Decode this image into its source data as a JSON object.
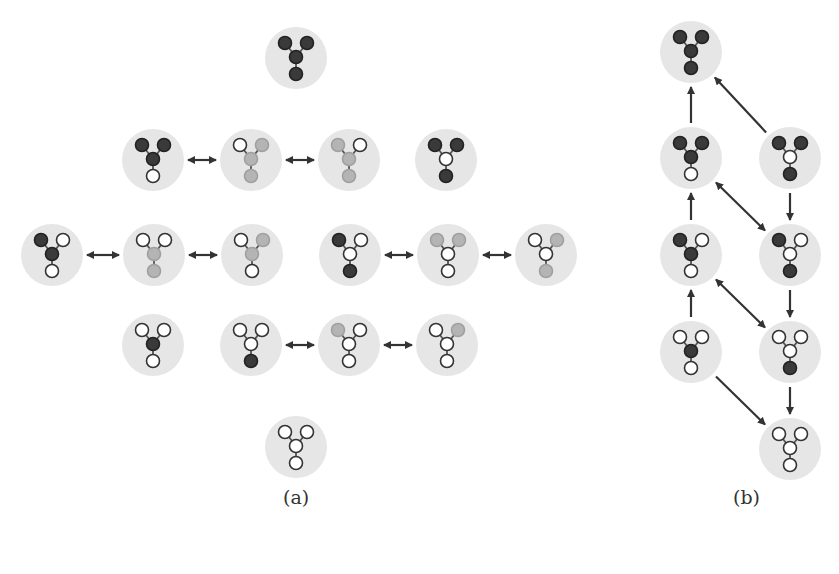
{
  "figure": {
    "panels": [
      {
        "id": "a",
        "caption": "(a)",
        "caption_pos": [
          283,
          502
        ],
        "nodes": [
          {
            "id": "a1",
            "x": 296,
            "y": 58,
            "states": [
              "D",
              "D",
              "D",
              "D"
            ]
          },
          {
            "id": "a2",
            "x": 153,
            "y": 160,
            "states": [
              "D",
              "D",
              "D",
              "W"
            ]
          },
          {
            "id": "a3",
            "x": 251,
            "y": 160,
            "states": [
              "W",
              "L",
              "L",
              "L"
            ]
          },
          {
            "id": "a4",
            "x": 349,
            "y": 160,
            "states": [
              "L",
              "W",
              "L",
              "L"
            ]
          },
          {
            "id": "a5",
            "x": 446,
            "y": 160,
            "states": [
              "D",
              "D",
              "W",
              "D"
            ]
          },
          {
            "id": "a6",
            "x": 52,
            "y": 255,
            "states": [
              "D",
              "W",
              "D",
              "W"
            ]
          },
          {
            "id": "a7",
            "x": 154,
            "y": 255,
            "states": [
              "W",
              "W",
              "L",
              "L"
            ]
          },
          {
            "id": "a8",
            "x": 252,
            "y": 255,
            "states": [
              "W",
              "L",
              "L",
              "W"
            ]
          },
          {
            "id": "a9",
            "x": 350,
            "y": 255,
            "states": [
              "D",
              "W",
              "W",
              "D"
            ]
          },
          {
            "id": "a10",
            "x": 448,
            "y": 255,
            "states": [
              "L",
              "L",
              "W",
              "W"
            ]
          },
          {
            "id": "a11",
            "x": 546,
            "y": 255,
            "states": [
              "W",
              "L",
              "W",
              "L"
            ]
          },
          {
            "id": "a12",
            "x": 153,
            "y": 345,
            "states": [
              "W",
              "W",
              "D",
              "W"
            ]
          },
          {
            "id": "a13",
            "x": 251,
            "y": 345,
            "states": [
              "W",
              "W",
              "W",
              "D"
            ]
          },
          {
            "id": "a14",
            "x": 349,
            "y": 345,
            "states": [
              "L",
              "W",
              "W",
              "W"
            ]
          },
          {
            "id": "a15",
            "x": 447,
            "y": 345,
            "states": [
              "W",
              "L",
              "W",
              "W"
            ]
          },
          {
            "id": "a16",
            "x": 296,
            "y": 447,
            "states": [
              "W",
              "W",
              "W",
              "W"
            ]
          }
        ],
        "edges": [
          {
            "from": "a2",
            "to": "a3",
            "type": "bidirectional"
          },
          {
            "from": "a3",
            "to": "a4",
            "type": "bidirectional"
          },
          {
            "from": "a6",
            "to": "a7",
            "type": "bidirectional"
          },
          {
            "from": "a7",
            "to": "a8",
            "type": "bidirectional"
          },
          {
            "from": "a9",
            "to": "a10",
            "type": "bidirectional"
          },
          {
            "from": "a10",
            "to": "a11",
            "type": "bidirectional"
          },
          {
            "from": "a13",
            "to": "a14",
            "type": "bidirectional"
          },
          {
            "from": "a14",
            "to": "a15",
            "type": "bidirectional"
          }
        ]
      },
      {
        "id": "b",
        "caption": "(b)",
        "caption_pos": [
          733,
          502
        ],
        "nodes": [
          {
            "id": "b1",
            "x": 691,
            "y": 52,
            "states": [
              "D",
              "D",
              "D",
              "D"
            ]
          },
          {
            "id": "b2",
            "x": 691,
            "y": 158,
            "states": [
              "D",
              "D",
              "D",
              "W"
            ]
          },
          {
            "id": "b3",
            "x": 790,
            "y": 158,
            "states": [
              "D",
              "D",
              "W",
              "D"
            ]
          },
          {
            "id": "b4",
            "x": 691,
            "y": 255,
            "states": [
              "D",
              "W",
              "D",
              "W"
            ]
          },
          {
            "id": "b5",
            "x": 790,
            "y": 255,
            "states": [
              "D",
              "W",
              "W",
              "D"
            ]
          },
          {
            "id": "b6",
            "x": 691,
            "y": 352,
            "states": [
              "W",
              "W",
              "D",
              "W"
            ]
          },
          {
            "id": "b7",
            "x": 790,
            "y": 352,
            "states": [
              "W",
              "W",
              "W",
              "D"
            ]
          },
          {
            "id": "b8",
            "x": 790,
            "y": 449,
            "states": [
              "W",
              "W",
              "W",
              "W"
            ]
          }
        ],
        "edges": [
          {
            "from": "b2",
            "to": "b1",
            "type": "directed"
          },
          {
            "from": "b3",
            "to": "b1",
            "type": "directed"
          },
          {
            "from": "b3",
            "to": "b5",
            "type": "directed"
          },
          {
            "from": "b4",
            "to": "b2",
            "type": "directed"
          },
          {
            "from": "b2",
            "to": "b5",
            "type": "bidirectional"
          },
          {
            "from": "b6",
            "to": "b4",
            "type": "directed"
          },
          {
            "from": "b5",
            "to": "b7",
            "type": "directed"
          },
          {
            "from": "b4",
            "to": "b7",
            "type": "bidirectional"
          },
          {
            "from": "b7",
            "to": "b8",
            "type": "directed"
          },
          {
            "from": "b6",
            "to": "b8",
            "type": "directed"
          }
        ]
      }
    ],
    "legend_states": {
      "D": {
        "meaning": "dark filled atom",
        "fill": "#3a3a3a",
        "stroke": "#222222"
      },
      "L": {
        "meaning": "light grey atom",
        "fill": "#b4b4b4",
        "stroke": "#a0a0a0"
      },
      "W": {
        "meaning": "white / hollow atom",
        "fill": "#ffffff",
        "stroke": "#333333"
      }
    },
    "node_atom_order": [
      "top-left",
      "top-right",
      "center",
      "bottom"
    ]
  },
  "captions": {
    "a": "(a)",
    "b": "(b)"
  }
}
